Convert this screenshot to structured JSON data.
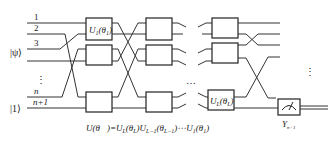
{
  "diagram": {
    "wire_labels": [
      "1",
      "2",
      "3",
      "n",
      "n+1"
    ],
    "input_states": {
      "psi": "|ψ⟩",
      "one": "|1⟩"
    },
    "vertical_ellipsis": "⋮",
    "horizontal_ellipsis": "…",
    "gates": {
      "first": {
        "name": "U",
        "sub": "1",
        "arg": "θ",
        "arg_sub": "1"
      },
      "last": {
        "name": "U",
        "sub": "L",
        "arg": "θ",
        "arg_sub": "L"
      }
    },
    "measurement": {
      "label": "Y",
      "sub": "n+1"
    },
    "equation": "U(θ⃗)=U_L(θ_L)U_{L−1}(θ_{L−1})⋯U_1(θ_1)",
    "equation_parts": {
      "lhs": "U(",
      "lhs_arg": "θ⃗",
      "eq": ")=",
      "t1": "U",
      "t1s": "L",
      "t1a": "(θ",
      "t1as": "L",
      "t1c": ")",
      "t2": "U",
      "t2s": "L−1",
      "t2a": "(θ",
      "t2as": "L−1",
      "t2c": ")",
      "dots": "⋯",
      "t3": "U",
      "t3s": "1",
      "t3a": "(θ",
      "t3as": "1",
      "t3c": ")"
    }
  }
}
